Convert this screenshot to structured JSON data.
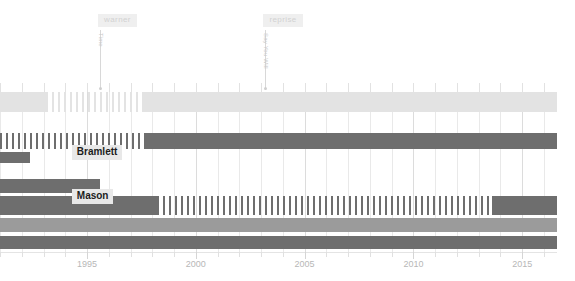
{
  "chart_data": {
    "type": "bar",
    "title": "",
    "subtitle": "",
    "xlabel": "",
    "ylabel": "",
    "xlim": [
      1991.0,
      2016.6
    ],
    "grid": true,
    "legend": "none",
    "axis": {
      "tick_labels": [
        "1995",
        "2000",
        "2005",
        "2010",
        "2015"
      ],
      "tick_values": [
        1995,
        2000,
        2005,
        2010,
        2015
      ],
      "minor_tick_step": 1
    },
    "annotations": [
      {
        "id": "warner",
        "chip_label": "warner",
        "rotated_label": "Time",
        "x_value": 1995.6
      },
      {
        "id": "reprise",
        "chip_label": "reprise",
        "rotated_label": "Say You Will",
        "x_value": 2003.2
      }
    ],
    "inline_labels": [
      {
        "label": "Bramlett",
        "x_value": 1994.3,
        "row": 1
      },
      {
        "label": "Mason",
        "x_value": 1994.3,
        "row": 3
      }
    ],
    "colors": {
      "row_light": "#e3e3e3",
      "row_mid": "#9b9b9b",
      "row_dark": "#6e6e6e",
      "grid": "#e9e9e9",
      "axis_text": "#b7b7b7",
      "chip_bg": "#efefef",
      "chip_text": "#d2d2d2",
      "label_bg": "#e8e8e8",
      "label_text": "#1c1c1c"
    },
    "series": [
      {
        "name": "row-1",
        "color": "#e3e3e3",
        "top": 92,
        "height": 20,
        "segments": [
          {
            "style": "solid",
            "x_start": 1991.0,
            "x_end": 1993.1
          },
          {
            "style": "striped",
            "x_start": 1993.1,
            "x_end": 1997.6
          },
          {
            "style": "solid",
            "x_start": 1997.6,
            "x_end": 2016.6
          }
        ]
      },
      {
        "name": "row-2",
        "color": "#6e6e6e",
        "top": 133,
        "height": 16,
        "segments": [
          {
            "style": "striped",
            "x_start": 1991.0,
            "x_end": 1997.6
          },
          {
            "style": "solid",
            "x_start": 1997.6,
            "x_end": 2016.6
          }
        ]
      },
      {
        "name": "row-3",
        "color": "#6e6e6e",
        "top": 152,
        "height": 11,
        "segments": [
          {
            "style": "solid",
            "x_start": 1991.0,
            "x_end": 1992.4
          }
        ]
      },
      {
        "name": "row-4",
        "color": "#6e6e6e",
        "top": 179,
        "height": 14,
        "segments": [
          {
            "style": "solid",
            "x_start": 1991.0,
            "x_end": 1995.6
          }
        ]
      },
      {
        "name": "row-5",
        "color": "#6e6e6e",
        "top": 196,
        "height": 19,
        "segments": [
          {
            "style": "solid",
            "x_start": 1991.0,
            "x_end": 1998.2
          },
          {
            "style": "striped",
            "x_start": 1998.2,
            "x_end": 2013.6
          },
          {
            "style": "solid",
            "x_start": 2013.6,
            "x_end": 2016.6
          }
        ]
      },
      {
        "name": "row-6",
        "color": "#9b9b9b",
        "top": 218,
        "height": 14,
        "segments": [
          {
            "style": "solid",
            "x_start": 1991.0,
            "x_end": 2016.6
          }
        ]
      },
      {
        "name": "row-7",
        "color": "#6e6e6e",
        "top": 236,
        "height": 13,
        "segments": [
          {
            "style": "solid",
            "x_start": 1991.0,
            "x_end": 2016.6
          }
        ]
      }
    ]
  }
}
